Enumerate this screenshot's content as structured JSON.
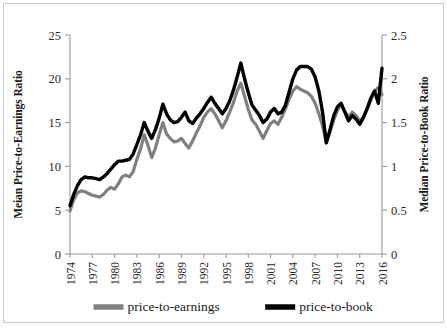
{
  "chart_data": {
    "type": "line",
    "title": "",
    "xlabel": "",
    "ylabel": "Meian Price-to-Earnings Ratio",
    "y2label": "Median Price-to-Book Ratio",
    "grid": false,
    "legend_position": "bottom",
    "xlim": [
      1974,
      2016
    ],
    "ylim": [
      0,
      25
    ],
    "y2lim": [
      0,
      2.5
    ],
    "yticks": [
      "0",
      "5",
      "10",
      "15",
      "20",
      "25"
    ],
    "ytick_values": [
      0,
      5,
      10,
      15,
      20,
      25
    ],
    "y2ticks": [
      "0",
      "0.5",
      "1",
      "1.5",
      "2",
      "2.5"
    ],
    "y2tick_values": [
      0,
      0.5,
      1,
      1.5,
      2,
      2.5
    ],
    "xticks": [
      "1974",
      "1977",
      "1980",
      "1983",
      "1986",
      "1989",
      "1992",
      "1995",
      "1998",
      "2001",
      "2004",
      "2007",
      "2010",
      "2013",
      "2016"
    ],
    "xtick_values": [
      1974,
      1977,
      1980,
      1983,
      1986,
      1989,
      1992,
      1995,
      1998,
      2001,
      2004,
      2007,
      2010,
      2013,
      2016
    ],
    "x": [
      1974,
      1974.5,
      1975,
      1975.5,
      1976,
      1976.5,
      1977,
      1977.5,
      1978,
      1978.5,
      1979,
      1979.5,
      1980,
      1980.5,
      1981,
      1981.5,
      1982,
      1982.5,
      1983,
      1983.5,
      1984,
      1984.5,
      1985,
      1985.5,
      1986,
      1986.5,
      1987,
      1987.5,
      1988,
      1988.5,
      1989,
      1989.5,
      1990,
      1990.5,
      1991,
      1991.5,
      1992,
      1992.5,
      1993,
      1993.5,
      1994,
      1994.5,
      1995,
      1995.5,
      1996,
      1996.5,
      1997,
      1997.5,
      1998,
      1998.5,
      1999,
      1999.5,
      2000,
      2000.5,
      2001,
      2001.5,
      2002,
      2002.5,
      2003,
      2003.5,
      2004,
      2004.5,
      2005,
      2005.5,
      2006,
      2006.5,
      2007,
      2007.5,
      2008,
      2008.5,
      2009,
      2009.5,
      2010,
      2010.5,
      2011,
      2011.5,
      2012,
      2012.5,
      2013,
      2013.5,
      2014,
      2014.5,
      2015,
      2015.5,
      2016
    ],
    "series": [
      {
        "name": "price-to-earnings",
        "axis": "left",
        "color": "#808080",
        "linewidth": 3.2,
        "values": [
          4.9,
          6.2,
          7.0,
          7.2,
          7.1,
          6.9,
          6.7,
          6.6,
          6.5,
          6.8,
          7.3,
          7.6,
          7.4,
          8.0,
          8.8,
          9.0,
          8.8,
          9.4,
          10.8,
          12.0,
          13.6,
          12.4,
          11.0,
          12.1,
          13.6,
          15.0,
          13.7,
          13.2,
          12.8,
          12.9,
          13.2,
          12.6,
          12.1,
          12.9,
          13.8,
          14.6,
          15.6,
          16.2,
          16.6,
          16.0,
          15.2,
          14.4,
          15.2,
          16.2,
          17.3,
          18.6,
          19.5,
          18.0,
          16.5,
          15.3,
          14.8,
          14.0,
          13.2,
          14.1,
          14.9,
          15.2,
          14.8,
          15.6,
          16.6,
          17.7,
          18.6,
          19.1,
          18.8,
          18.6,
          18.4,
          18.0,
          17.2,
          16.0,
          14.6,
          12.7,
          13.9,
          15.3,
          16.4,
          17.1,
          16.2,
          15.7,
          16.2,
          15.8,
          15.2,
          15.6,
          16.6,
          17.6,
          18.6,
          19.0,
          18.2
        ]
      },
      {
        "name": "price-to-book",
        "axis": "right",
        "color": "#000000",
        "linewidth": 3.4,
        "values": [
          0.55,
          0.68,
          0.78,
          0.85,
          0.88,
          0.87,
          0.87,
          0.86,
          0.85,
          0.88,
          0.92,
          0.97,
          1.02,
          1.06,
          1.06,
          1.07,
          1.08,
          1.14,
          1.25,
          1.36,
          1.5,
          1.4,
          1.32,
          1.42,
          1.55,
          1.71,
          1.6,
          1.53,
          1.5,
          1.51,
          1.56,
          1.62,
          1.52,
          1.49,
          1.55,
          1.6,
          1.66,
          1.73,
          1.79,
          1.72,
          1.66,
          1.6,
          1.66,
          1.75,
          1.87,
          2.02,
          2.18,
          2.0,
          1.84,
          1.7,
          1.64,
          1.58,
          1.5,
          1.54,
          1.62,
          1.66,
          1.6,
          1.62,
          1.7,
          1.85,
          2.0,
          2.1,
          2.14,
          2.14,
          2.14,
          2.11,
          2.02,
          1.86,
          1.62,
          1.27,
          1.42,
          1.58,
          1.68,
          1.72,
          1.62,
          1.52,
          1.58,
          1.54,
          1.48,
          1.56,
          1.66,
          1.78,
          1.86,
          1.72,
          2.12
        ]
      }
    ],
    "legend": [
      {
        "label": "price-to-earnings",
        "color": "#808080"
      },
      {
        "label": "price-to-book",
        "color": "#000000"
      }
    ]
  }
}
